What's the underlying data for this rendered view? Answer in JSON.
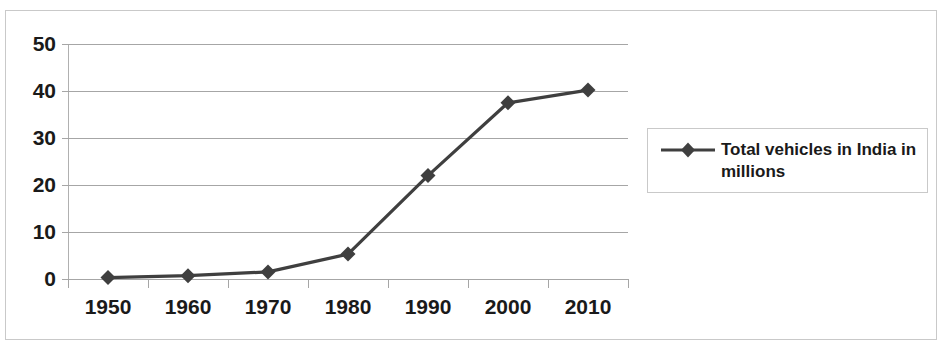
{
  "chart_data": {
    "type": "line",
    "title": "",
    "subtitle": "",
    "xlabel": "",
    "ylabel": "",
    "categories": [
      "1950",
      "1960",
      "1970",
      "1980",
      "1990",
      "2000",
      "2010"
    ],
    "series": [
      {
        "name": "Total vehicles in India in millions",
        "values": [
          0.3,
          0.7,
          1.5,
          5.3,
          22.0,
          37.5,
          40.2
        ],
        "color": "#3f3f3f",
        "marker": "diamond"
      }
    ],
    "ylim": [
      0,
      50
    ],
    "yticks": [
      0,
      10,
      20,
      30,
      40,
      50
    ],
    "ytick_labels": [
      "0",
      "10",
      "20",
      "30",
      "40",
      "50"
    ],
    "grid": "horizontal",
    "legend": {
      "position": "right",
      "entries": [
        "Total vehicles in India in millions"
      ]
    }
  },
  "legend": {
    "label": "Total vehicles in India in millions"
  },
  "colors": {
    "series": "#3f3f3f",
    "gridline": "#a6a6a6",
    "axis": "#a6a6a6",
    "frame": "#c9c9c9",
    "text": "#1a1a1a",
    "background": "#ffffff"
  }
}
